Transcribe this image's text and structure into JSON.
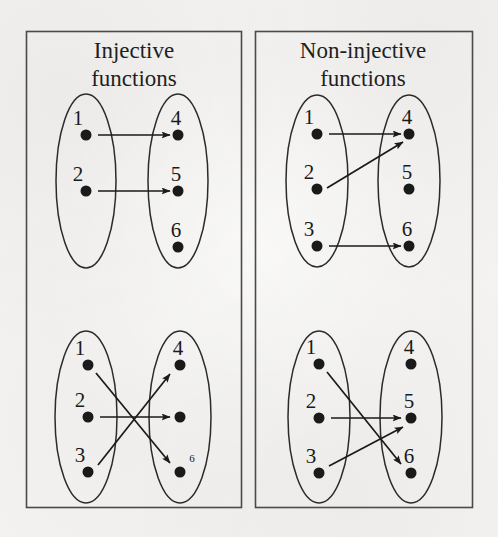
{
  "figure": {
    "width": 498,
    "height": 537,
    "background_color": "#f4f3f1",
    "ink_color": "#1a1a1a",
    "border_color": "#4a4a4a",
    "caption_note": "Diagram contrasting injective (one-to-one) and non-injective mappings between a 3-element domain and a 3-element codomain"
  },
  "panels": [
    {
      "id": "left-column",
      "title_lines": [
        "Injective",
        "functions"
      ],
      "title_x": 134,
      "box": {
        "x": 26,
        "y": 31,
        "width": 215,
        "height": 476
      },
      "title_y_first": 58,
      "title_line_height": 28,
      "diagrams": [
        {
          "id": "injective-top",
          "injective": true,
          "domain_ellipse": {
            "cx": 86,
            "cy": 181,
            "rx": 30,
            "ry": 87
          },
          "codomain_ellipse": {
            "cx": 178,
            "cy": 181,
            "rx": 30,
            "ry": 87
          },
          "domain_nodes": [
            {
              "label": "1",
              "x": 86,
              "y": 135,
              "label_dx": -8,
              "label_dy": -10
            },
            {
              "label": "2",
              "x": 86,
              "y": 191,
              "label_dx": -8,
              "label_dy": -10
            }
          ],
          "codomain_nodes": [
            {
              "label": "4",
              "x": 178,
              "y": 135,
              "label_dx": -2,
              "label_dy": -10
            },
            {
              "label": "5",
              "x": 178,
              "y": 191,
              "label_dx": -2,
              "label_dy": -10
            },
            {
              "label": "6",
              "x": 178,
              "y": 247,
              "label_dx": -2,
              "label_dy": -10
            }
          ],
          "arrows": [
            {
              "from": "1",
              "to": "4",
              "x1": 98,
              "y1": 135,
              "x2": 170,
              "y2": 135
            },
            {
              "from": "2",
              "to": "5",
              "x1": 98,
              "y1": 191,
              "x2": 170,
              "y2": 191
            }
          ]
        },
        {
          "id": "injective-bottom",
          "injective": true,
          "domain_ellipse": {
            "cx": 86,
            "cy": 417,
            "rx": 31,
            "ry": 86
          },
          "codomain_ellipse": {
            "cx": 180,
            "cy": 417,
            "rx": 31,
            "ry": 86
          },
          "domain_nodes": [
            {
              "label": "1",
              "x": 88,
              "y": 365,
              "label_dx": -8,
              "label_dy": -10
            },
            {
              "label": "2",
              "x": 88,
              "y": 417,
              "label_dx": -8,
              "label_dy": -10
            },
            {
              "label": "3",
              "x": 88,
              "y": 472,
              "label_dx": -8,
              "label_dy": -10
            }
          ],
          "codomain_nodes": [
            {
              "label": "4",
              "x": 180,
              "y": 365,
              "label_dx": -2,
              "label_dy": -10
            },
            {
              "label": "",
              "x": 180,
              "y": 417,
              "label_dx": 0,
              "label_dy": 0
            },
            {
              "label": "6",
              "x": 180,
              "y": 472,
              "label_dx": 12,
              "label_dy": -10,
              "small": true
            }
          ],
          "arrows": [
            {
              "from": "1",
              "to": "6",
              "x1": 96,
              "y1": 373,
              "x2": 170,
              "y2": 463
            },
            {
              "from": "2",
              "to": "5",
              "x1": 100,
              "y1": 417,
              "x2": 170,
              "y2": 417
            },
            {
              "from": "3",
              "to": "4",
              "x1": 98,
              "y1": 465,
              "x2": 170,
              "y2": 374
            }
          ]
        }
      ]
    },
    {
      "id": "right-column",
      "title_lines": [
        "Non-injective",
        "functions"
      ],
      "title_x": 363,
      "box": {
        "x": 255,
        "y": 31,
        "width": 217,
        "height": 476
      },
      "title_y_first": 58,
      "title_line_height": 28,
      "diagrams": [
        {
          "id": "non-injective-top",
          "injective": false,
          "domain_ellipse": {
            "cx": 317,
            "cy": 181,
            "rx": 31,
            "ry": 86
          },
          "codomain_ellipse": {
            "cx": 409,
            "cy": 181,
            "rx": 31,
            "ry": 86
          },
          "domain_nodes": [
            {
              "label": "1",
              "x": 317,
              "y": 134,
              "label_dx": -8,
              "label_dy": -10
            },
            {
              "label": "2",
              "x": 317,
              "y": 189,
              "label_dx": -8,
              "label_dy": -10
            },
            {
              "label": "3",
              "x": 317,
              "y": 246,
              "label_dx": -8,
              "label_dy": -10
            }
          ],
          "codomain_nodes": [
            {
              "label": "4",
              "x": 409,
              "y": 134,
              "label_dx": -2,
              "label_dy": -10
            },
            {
              "label": "5",
              "x": 409,
              "y": 189,
              "label_dx": -2,
              "label_dy": -10
            },
            {
              "label": "6",
              "x": 409,
              "y": 246,
              "label_dx": -2,
              "label_dy": -10
            }
          ],
          "arrows": [
            {
              "from": "1",
              "to": "4",
              "x1": 329,
              "y1": 134,
              "x2": 401,
              "y2": 134
            },
            {
              "from": "2",
              "to": "4",
              "x1": 327,
              "y1": 188,
              "x2": 403,
              "y2": 142
            },
            {
              "from": "3",
              "to": "6",
              "x1": 329,
              "y1": 246,
              "x2": 401,
              "y2": 246
            }
          ]
        },
        {
          "id": "non-injective-bottom",
          "injective": false,
          "domain_ellipse": {
            "cx": 319,
            "cy": 417,
            "rx": 31,
            "ry": 86
          },
          "codomain_ellipse": {
            "cx": 411,
            "cy": 417,
            "rx": 31,
            "ry": 86
          },
          "domain_nodes": [
            {
              "label": "1",
              "x": 319,
              "y": 364,
              "label_dx": -8,
              "label_dy": -10
            },
            {
              "label": "2",
              "x": 319,
              "y": 418,
              "label_dx": -8,
              "label_dy": -10
            },
            {
              "label": "3",
              "x": 319,
              "y": 473,
              "label_dx": -8,
              "label_dy": -10
            }
          ],
          "codomain_nodes": [
            {
              "label": "4",
              "x": 411,
              "y": 364,
              "label_dx": -2,
              "label_dy": -10
            },
            {
              "label": "5",
              "x": 411,
              "y": 418,
              "label_dx": -2,
              "label_dy": -10
            },
            {
              "label": "6",
              "x": 411,
              "y": 473,
              "label_dx": -2,
              "label_dy": -10
            }
          ],
          "arrows": [
            {
              "from": "1",
              "to": "6",
              "x1": 327,
              "y1": 372,
              "x2": 401,
              "y2": 464
            },
            {
              "from": "2",
              "to": "5",
              "x1": 331,
              "y1": 418,
              "x2": 401,
              "y2": 418
            },
            {
              "from": "3",
              "to": "5",
              "x1": 329,
              "y1": 466,
              "x2": 403,
              "y2": 427
            }
          ]
        }
      ]
    }
  ],
  "legend": {
    "domain_set_name": "domain",
    "codomain_set_name": "codomain",
    "dot_radius": 5.5
  }
}
